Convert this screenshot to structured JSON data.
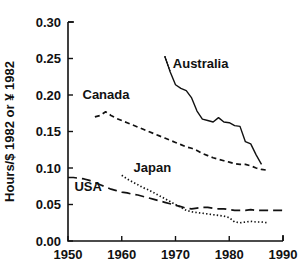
{
  "chart_data": {
    "type": "line",
    "title": "",
    "xlabel": "",
    "ylabel": "Hours/$ 1982 or ¥ 1982",
    "xlim": [
      1950,
      1990
    ],
    "ylim": [
      0.0,
      0.3
    ],
    "grid": false,
    "legend_position": "inline-annotations",
    "xticks": [
      "1950",
      "1960",
      "1970",
      "1980",
      "1990"
    ],
    "xtick_values": [
      1950,
      1960,
      1970,
      1980,
      1990
    ],
    "yticks": [
      "0.00",
      "0.05",
      "0.10",
      "0.15",
      "0.20",
      "0.25",
      "0.30"
    ],
    "ytick_values": [
      0.0,
      0.05,
      0.1,
      0.15,
      0.2,
      0.25,
      0.3
    ],
    "series": [
      {
        "name": "Australia",
        "style": "solid",
        "label_text": "Australia",
        "x": [
          1968,
          1969,
          1970,
          1971,
          1972,
          1973,
          1974,
          1975,
          1976,
          1977,
          1978,
          1979,
          1980,
          1981,
          1982,
          1983,
          1984,
          1985,
          1986
        ],
        "values": [
          0.253,
          0.232,
          0.214,
          0.209,
          0.206,
          0.196,
          0.178,
          0.167,
          0.165,
          0.163,
          0.169,
          0.163,
          0.162,
          0.158,
          0.157,
          0.136,
          0.133,
          0.118,
          0.105
        ]
      },
      {
        "name": "Canada",
        "style": "dashed",
        "label_text": "Canada",
        "x": [
          1955,
          1956,
          1957,
          1958,
          1959,
          1960,
          1961,
          1962,
          1963,
          1964,
          1965,
          1966,
          1967,
          1968,
          1969,
          1970,
          1971,
          1972,
          1973,
          1974,
          1975,
          1976,
          1977,
          1978,
          1979,
          1980,
          1981,
          1982,
          1983,
          1984,
          1985,
          1986,
          1987
        ],
        "values": [
          0.17,
          0.172,
          0.177,
          0.172,
          0.168,
          0.165,
          0.162,
          0.159,
          0.156,
          0.153,
          0.15,
          0.147,
          0.144,
          0.141,
          0.138,
          0.135,
          0.132,
          0.129,
          0.127,
          0.124,
          0.12,
          0.117,
          0.114,
          0.112,
          0.11,
          0.108,
          0.106,
          0.105,
          0.105,
          0.103,
          0.1,
          0.098,
          0.097
        ]
      },
      {
        "name": "Japan",
        "style": "dotted",
        "label_text": "Japan",
        "x": [
          1960,
          1961,
          1962,
          1963,
          1964,
          1965,
          1966,
          1967,
          1968,
          1969,
          1970,
          1971,
          1972,
          1973,
          1974,
          1975,
          1976,
          1977,
          1978,
          1979,
          1980,
          1981,
          1982,
          1983,
          1984,
          1985,
          1986,
          1987
        ],
        "values": [
          0.09,
          0.085,
          0.081,
          0.077,
          0.073,
          0.07,
          0.066,
          0.062,
          0.058,
          0.054,
          0.05,
          0.046,
          0.042,
          0.04,
          0.039,
          0.038,
          0.037,
          0.036,
          0.035,
          0.034,
          0.032,
          0.026,
          0.025,
          0.026,
          0.027,
          0.026,
          0.026,
          0.025
        ]
      },
      {
        "name": "USA",
        "style": "long-dashed",
        "label_text": "USA",
        "x": [
          1950,
          1951,
          1952,
          1953,
          1954,
          1955,
          1956,
          1957,
          1958,
          1959,
          1960,
          1961,
          1962,
          1963,
          1964,
          1965,
          1966,
          1967,
          1968,
          1969,
          1970,
          1971,
          1972,
          1973,
          1974,
          1975,
          1976,
          1977,
          1978,
          1979,
          1980,
          1981,
          1982,
          1983,
          1984,
          1985,
          1986,
          1987,
          1988,
          1989,
          1990
        ],
        "values": [
          0.087,
          0.087,
          0.086,
          0.085,
          0.083,
          0.08,
          0.077,
          0.074,
          0.071,
          0.069,
          0.067,
          0.066,
          0.064,
          0.063,
          0.061,
          0.059,
          0.057,
          0.055,
          0.053,
          0.051,
          0.049,
          0.047,
          0.045,
          0.044,
          0.045,
          0.046,
          0.046,
          0.045,
          0.044,
          0.044,
          0.043,
          0.042,
          0.042,
          0.042,
          0.043,
          0.042,
          0.042,
          0.042,
          0.042,
          0.042,
          0.042
        ]
      }
    ],
    "annotations": [
      {
        "text": "Australia",
        "x": 1969.5,
        "y": 0.237
      },
      {
        "text": "Canada",
        "x": 1952.7,
        "y": 0.194
      },
      {
        "text": "Japan",
        "x": 1962.2,
        "y": 0.094
      },
      {
        "text": "USA",
        "x": 1951.2,
        "y": 0.069
      }
    ]
  },
  "colors": {
    "ink": "#111111",
    "background": "#ffffff"
  }
}
